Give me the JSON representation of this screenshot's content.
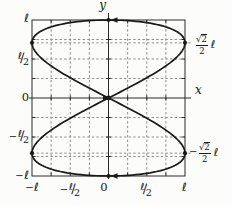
{
  "figure": {
    "background": "#fcfcfa",
    "curve_color": "#1a1a1a",
    "grid_color": "#8f8f8f",
    "axis_color": "#2a2a2a"
  },
  "labels": {
    "x_axis": "x",
    "y_axis": "y",
    "zero": "0",
    "ell": "ℓ",
    "minus": "−",
    "two": "2",
    "sqrt_sym": "√",
    "frac_slash": "∕"
  },
  "chart_data": {
    "type": "line",
    "title": "",
    "curve": "figure-eight Lissajous curve: x = ℓ sin 2t, y = ℓ sin t",
    "parametric": {
      "x_coeff_t": 2,
      "y_coeff_t": 1,
      "amplitude": "ℓ",
      "t_range": [
        0,
        6.2832
      ]
    },
    "xlabel": "x",
    "ylabel": "y",
    "xlim": [
      "-ℓ",
      "ℓ"
    ],
    "ylim": [
      "-ℓ",
      "ℓ"
    ],
    "x_tick_labels": [
      "-ℓ",
      "-ℓ/2",
      "0",
      "ℓ/2",
      "ℓ"
    ],
    "y_tick_labels": [
      "ℓ",
      "ℓ/2",
      "0",
      "-ℓ/2",
      "-ℓ"
    ],
    "right_annotations": [
      {
        "text": "√2/2 ℓ",
        "y": 0.7071
      },
      {
        "text": "-√2/2 ℓ",
        "y": -0.7071
      }
    ],
    "grid": "dashed, spacing ℓ/4, border box solid",
    "grid_fractions": [
      -0.75,
      -0.5,
      -0.25,
      0.25,
      0.5,
      0.75
    ],
    "leader_fractions": [
      0.7071,
      -0.7071
    ],
    "marked_points": [
      [
        -1,
        0.7071
      ],
      [
        1,
        0.7071
      ],
      [
        -1,
        -0.7071
      ],
      [
        1,
        -0.7071
      ],
      [
        0,
        1
      ],
      [
        0,
        -1
      ],
      [
        0,
        0
      ]
    ],
    "direction_arrows": [
      {
        "at": [
          0,
          1
        ],
        "dir": "left"
      },
      {
        "at": [
          0,
          -1
        ],
        "dir": "left"
      },
      {
        "at": [
          0,
          0
        ],
        "dir": "right"
      }
    ],
    "samples": 240
  }
}
